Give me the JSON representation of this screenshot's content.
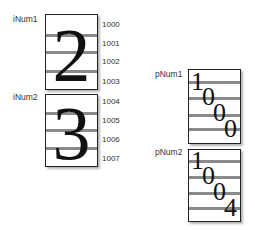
{
  "int_variables": [
    {
      "label": "iNum1",
      "value_glyph": "2",
      "addresses": [
        "1000",
        "1001",
        "1002",
        "1003"
      ]
    },
    {
      "label": "iNum2",
      "value_glyph": "3",
      "addresses": [
        "1004",
        "1005",
        "1006",
        "1007"
      ]
    }
  ],
  "pointer_variables": [
    {
      "label": "pNum1",
      "digits": [
        "1",
        "0",
        "0",
        "0"
      ]
    },
    {
      "label": "pNum2",
      "digits": [
        "1",
        "0",
        "0",
        "4"
      ]
    }
  ],
  "colors": {
    "stripe": "#8a8a8a",
    "border": "#222222",
    "shadow": "#b5b5b5"
  }
}
